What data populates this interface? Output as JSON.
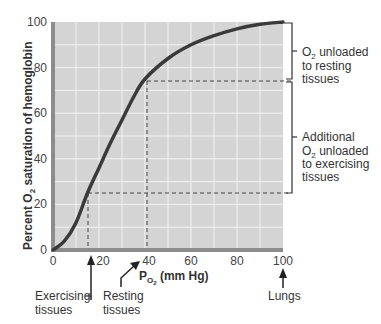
{
  "chart_data": {
    "type": "line",
    "title": "",
    "xlabel": "PO2 (mm Hg)",
    "ylabel": "Percent O2 saturation of hemoglobin",
    "xlim": [
      0,
      100
    ],
    "ylim": [
      0,
      100
    ],
    "grid": true,
    "x_ticks": [
      0,
      20,
      40,
      60,
      80,
      100
    ],
    "y_ticks": [
      0,
      20,
      40,
      60,
      80,
      100
    ],
    "series": [
      {
        "name": "Oxygen-hemoglobin dissociation curve",
        "x": [
          0,
          5,
          10,
          15,
          20,
          25,
          30,
          35,
          40,
          50,
          60,
          70,
          80,
          90,
          100
        ],
        "y": [
          0,
          4,
          12,
          25,
          36,
          47,
          57,
          67,
          75,
          84,
          90,
          94,
          97,
          99,
          100
        ]
      }
    ],
    "reference_points": [
      {
        "label": "Exercising tissues",
        "x": 15,
        "y": 25
      },
      {
        "label": "Resting tissues",
        "x": 40,
        "y": 75
      },
      {
        "label": "Lungs",
        "x": 100,
        "y": 100
      }
    ],
    "brackets": [
      {
        "label": "O2 unloaded to resting tissues",
        "from": 75,
        "to": 100
      },
      {
        "label": "Additional O2 unloaded to exercising tissues",
        "from": 25,
        "to": 75
      }
    ]
  },
  "labels": {
    "ylabel_pre": "Percent O",
    "ylabel_sub": "2",
    "ylabel_post": " saturation of hemoglobin",
    "xlabel_pre": "P",
    "xlabel_sub": "O",
    "xlabel_subsub": "2",
    "xlabel_post": " (mm Hg)",
    "x_ticks": [
      "0",
      "20",
      "40",
      "60",
      "80",
      "100"
    ],
    "y_ticks": [
      "0",
      "20",
      "40",
      "60",
      "80",
      "100"
    ],
    "exercising_1": "Exercising",
    "exercising_2": "tissues",
    "resting_1": "Resting",
    "resting_2": "tissues",
    "lungs": "Lungs",
    "bracket1_line1_pre": "O",
    "bracket1_line1_sub": "2",
    "bracket1_line1_post": " unloaded",
    "bracket1_line2": "to resting",
    "bracket1_line3": "tissues",
    "bracket2_line1": "Additional",
    "bracket2_line2_pre": "O",
    "bracket2_line2_sub": "2",
    "bracket2_line2_post": " unloaded",
    "bracket2_line3": "to exercising",
    "bracket2_line4": "tissues"
  },
  "colors": {
    "plot_bg": "#d4d4d4",
    "grid": "#f2f2f2",
    "curve": "#3a3a3a",
    "axis_bar": "#8c8c8c"
  }
}
